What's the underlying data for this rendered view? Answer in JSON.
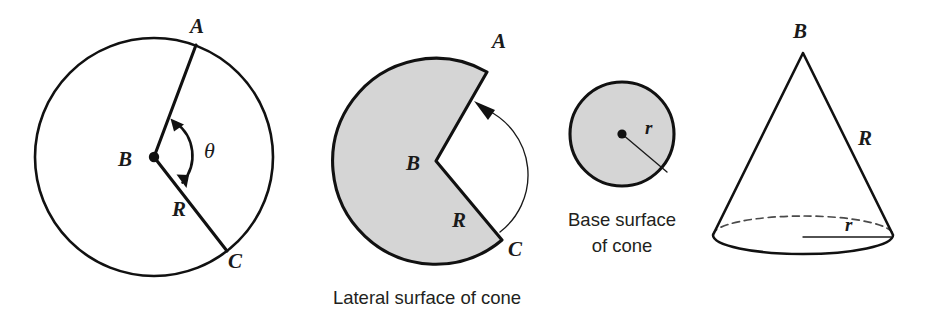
{
  "figure": {
    "title": "Cone surface area decomposition diagram",
    "background_color": "#ffffff",
    "stroke_color": "#111111",
    "shade_color": "#d5d5d5"
  },
  "panels": {
    "full_circle": {
      "name": "Full circle with central angle theta",
      "labels": {
        "point_a": "A",
        "point_b": "B",
        "point_c": "C",
        "radius": "R",
        "angle": "θ"
      }
    },
    "sector": {
      "name": "Shaded sector forming the lateral surface",
      "caption": "Lateral surface of cone",
      "labels": {
        "point_a": "A",
        "point_b": "B",
        "point_c": "C",
        "radius": "R"
      }
    },
    "base_circle": {
      "name": "Shaded base circle of the cone",
      "caption_line1": "Base surface",
      "caption_line2": "of cone",
      "labels": {
        "radius": "r"
      }
    },
    "cone": {
      "name": "Three dimensional cone",
      "labels": {
        "apex": "B",
        "slant": "R",
        "radius": "r"
      }
    }
  }
}
